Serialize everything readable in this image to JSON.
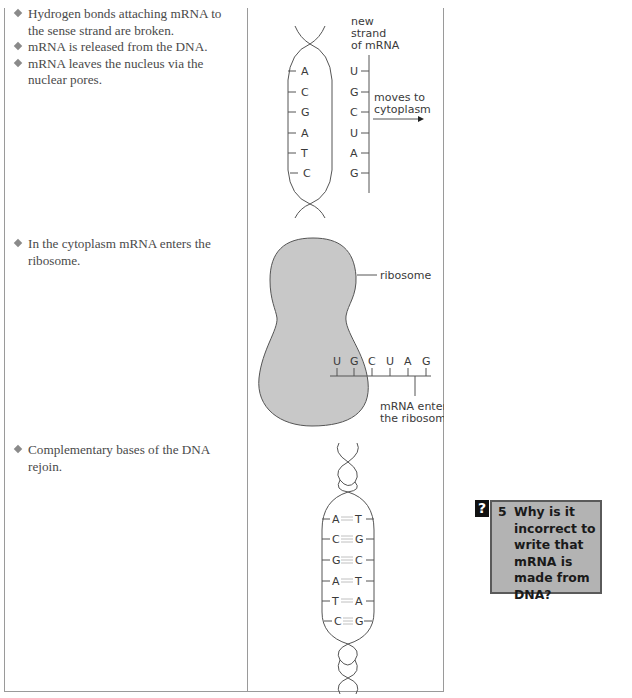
{
  "steps": [
    {
      "bullets": [
        "Hydrogen bonds attaching mRNA to the sense strand are broken.",
        "mRNA is released from the DNA.",
        "mRNA leaves the nucleus via the nuclear pores."
      ],
      "diagram": {
        "label_new_strand": [
          "new",
          "strand",
          "of mRNA"
        ],
        "dna_bases": [
          "A",
          "C",
          "G",
          "A",
          "T",
          "C"
        ],
        "mrna_bases": [
          "U",
          "G",
          "C",
          "U",
          "A",
          "G"
        ],
        "arrow_label": [
          "moves to",
          "cytoplasm"
        ]
      }
    },
    {
      "bullets": [
        "In the cytoplasm mRNA enters the ribosome."
      ],
      "diagram": {
        "ribosome_label": "ribosome",
        "mrna_bases": [
          "U",
          "G",
          "C",
          "U",
          "A",
          "G"
        ],
        "mrna_label": [
          "mRNA enters",
          "the ribosome"
        ]
      }
    },
    {
      "bullets": [
        "Complementary bases of the DNA rejoin."
      ],
      "diagram": {
        "base_pairs": [
          {
            "left": "A",
            "right": "T",
            "bonds": 2
          },
          {
            "left": "C",
            "right": "G",
            "bonds": 3
          },
          {
            "left": "G",
            "right": "C",
            "bonds": 3
          },
          {
            "left": "A",
            "right": "T",
            "bonds": 2
          },
          {
            "left": "T",
            "right": "A",
            "bonds": 2
          },
          {
            "left": "C",
            "right": "G",
            "bonds": 3
          }
        ]
      }
    }
  ],
  "question": {
    "icon": "?",
    "number": "5",
    "text": "Why is it incorrect to write that mRNA is made from DNA?"
  },
  "colors": {
    "ribosome_fill": "#c8c8c8",
    "question_box_fill": "#b3b3b3",
    "question_box_border": "#5a5a5a",
    "line": "#555555"
  }
}
